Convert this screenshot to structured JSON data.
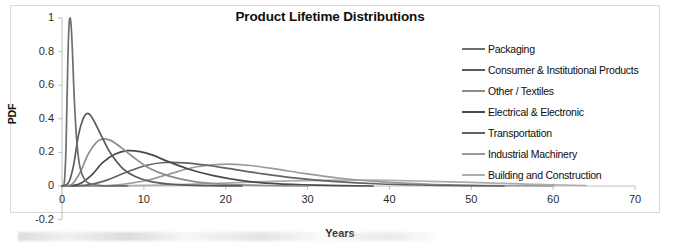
{
  "chart_data": {
    "type": "line",
    "title": "Product Lifetime Distributions",
    "xlabel": "Years",
    "ylabel": "PDF",
    "xlim": [
      0,
      70
    ],
    "ylim": [
      -0.2,
      1
    ],
    "xticks": [
      "0",
      "10",
      "20",
      "30",
      "40",
      "50",
      "60",
      "70"
    ],
    "xtick_values": [
      0,
      10,
      20,
      30,
      40,
      50,
      60,
      70
    ],
    "yticks": [
      "1",
      "0.8",
      "0.6",
      "0.4",
      "0.2",
      "0",
      "-0.2"
    ],
    "ytick_values": [
      1,
      0.8,
      0.6,
      0.4,
      0.2,
      0,
      -0.2
    ],
    "grid": false,
    "legend_position": "right",
    "series": [
      {
        "name": "Packaging",
        "color": "#6e6e6e",
        "peak_x": 1.0,
        "peak_y": 1.0,
        "distribution": "lognormal",
        "mu": 0.2,
        "sigma": 0.28,
        "scale": 1.0,
        "points_x": [
          0,
          0.3,
          0.5,
          0.7,
          0.85,
          1.0,
          1.15,
          1.3,
          1.5,
          1.8,
          2.2,
          2.8,
          3.5,
          4.5,
          6,
          8
        ],
        "points_y": [
          0,
          0.03,
          0.25,
          0.72,
          0.95,
          1.0,
          0.93,
          0.77,
          0.52,
          0.27,
          0.11,
          0.035,
          0.012,
          0.004,
          0.001,
          0
        ]
      },
      {
        "name": "Consumer & Institutional Products",
        "color": "#5a5a5a",
        "peak_x": 3.0,
        "peak_y": 0.43,
        "distribution": "lognormal",
        "mu": 1.2,
        "sigma": 0.45,
        "scale": 0.43,
        "points_x": [
          0,
          0.8,
          1.4,
          2.0,
          2.5,
          3.0,
          3.5,
          4.2,
          5.0,
          6.0,
          7.5,
          9.0,
          11,
          14,
          18,
          22
        ],
        "points_y": [
          0,
          0.02,
          0.12,
          0.3,
          0.39,
          0.43,
          0.42,
          0.36,
          0.28,
          0.19,
          0.1,
          0.055,
          0.025,
          0.008,
          0.002,
          0
        ]
      },
      {
        "name": "Other / Textiles",
        "color": "#8d8d8d",
        "peak_x": 5.0,
        "peak_y": 0.28,
        "distribution": "lognormal",
        "mu": 1.75,
        "sigma": 0.5,
        "scale": 0.28,
        "points_x": [
          0,
          1.2,
          2.2,
          3.2,
          4.2,
          5.0,
          6.0,
          7.2,
          8.5,
          10.5,
          13,
          16,
          20,
          25,
          30
        ],
        "points_y": [
          0,
          0.01,
          0.08,
          0.19,
          0.26,
          0.28,
          0.27,
          0.23,
          0.18,
          0.11,
          0.06,
          0.028,
          0.01,
          0.003,
          0
        ]
      },
      {
        "name": "Electrical & Electronic",
        "color": "#4a4a4a",
        "peak_x": 8.0,
        "peak_y": 0.21,
        "distribution": "lognormal",
        "mu": 2.25,
        "sigma": 0.52,
        "scale": 0.21,
        "points_x": [
          0,
          2,
          3.5,
          5,
          6.5,
          8,
          9.5,
          11,
          13,
          15.5,
          18.5,
          22,
          26,
          31,
          38
        ],
        "points_y": [
          0,
          0.01,
          0.06,
          0.14,
          0.19,
          0.21,
          0.205,
          0.185,
          0.145,
          0.1,
          0.062,
          0.032,
          0.014,
          0.005,
          0
        ]
      },
      {
        "name": "Transportation",
        "color": "#636363",
        "peak_x": 12.5,
        "peak_y": 0.14,
        "distribution": "lognormal",
        "mu": 2.7,
        "sigma": 0.55,
        "scale": 0.14,
        "points_x": [
          0,
          3,
          5.5,
          8,
          10.5,
          12.5,
          15,
          17.5,
          20.5,
          24,
          28,
          33,
          39,
          46,
          54
        ],
        "points_y": [
          0,
          0.005,
          0.035,
          0.085,
          0.125,
          0.14,
          0.138,
          0.125,
          0.103,
          0.076,
          0.05,
          0.028,
          0.012,
          0.004,
          0
        ]
      },
      {
        "name": "Industrial Machinery",
        "color": "#9a9a9a",
        "peak_x": 20.0,
        "peak_y": 0.13,
        "distribution": "lognormal",
        "mu": 3.1,
        "sigma": 0.42,
        "scale": 0.13,
        "points_x": [
          0,
          6,
          10,
          13,
          16,
          18.5,
          20.5,
          23,
          26,
          29.5,
          34,
          39,
          45,
          52,
          60
        ],
        "points_y": [
          0,
          0.004,
          0.03,
          0.07,
          0.11,
          0.126,
          0.13,
          0.122,
          0.102,
          0.075,
          0.046,
          0.024,
          0.01,
          0.003,
          0
        ]
      },
      {
        "name": "Building and Construction",
        "color": "#adadad",
        "peak_x": 34.0,
        "peak_y": 0.035,
        "distribution": "lognormal",
        "mu": 3.6,
        "sigma": 0.5,
        "scale": 0.035,
        "points_x": [
          0,
          6,
          12,
          18,
          23,
          28,
          32,
          36,
          40,
          45,
          50,
          55,
          60,
          64
        ],
        "points_y": [
          0,
          0.0005,
          0.005,
          0.014,
          0.023,
          0.031,
          0.034,
          0.035,
          0.033,
          0.028,
          0.021,
          0.014,
          0.007,
          0.003
        ]
      }
    ]
  },
  "axis": {
    "y_title": "PDF",
    "x_title": "Years"
  }
}
